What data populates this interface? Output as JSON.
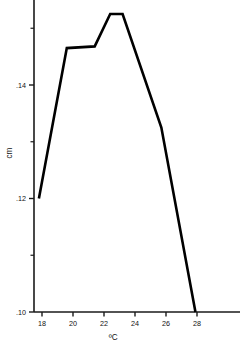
{
  "chart_data": {
    "type": "line",
    "title": "",
    "subtitle": "",
    "xlabel": "ºC",
    "ylabel": "cm",
    "xlim": [
      17.0,
      29.6
    ],
    "ylim": [
      0.0945,
      0.1565
    ],
    "grid": false,
    "legend": null,
    "x_ticks": [
      18,
      20,
      22,
      24,
      26,
      28
    ],
    "x_tick_labels": [
      "18",
      "20",
      "22",
      "24",
      "26",
      "28"
    ],
    "y_ticks": [
      0.1,
      0.11,
      0.12,
      0.13,
      0.14,
      0.15,
      0.156
    ],
    "y_tick_labels": [
      ".10",
      "",
      ".12",
      "",
      ".14",
      "",
      ""
    ],
    "y_labeled_ticks": [
      {
        "value": 0.1,
        "label": ".10"
      },
      {
        "value": 0.12,
        "label": ".12"
      },
      {
        "value": 0.14,
        "label": ".14"
      }
    ],
    "x": [
      17.8,
      19.6,
      21.4,
      22.4,
      23.2,
      25.7,
      27.9
    ],
    "values": [
      0.12,
      0.1465,
      0.1468,
      0.1525,
      0.1525,
      0.1325,
      0.1
    ],
    "series": [
      {
        "name": "",
        "points": [
          {
            "x": 17.8,
            "y": 0.12
          },
          {
            "x": 19.6,
            "y": 0.1465
          },
          {
            "x": 21.4,
            "y": 0.1468
          },
          {
            "x": 22.4,
            "y": 0.1525
          },
          {
            "x": 23.2,
            "y": 0.1525
          },
          {
            "x": 25.7,
            "y": 0.1325
          },
          {
            "x": 27.9,
            "y": 0.1
          }
        ]
      }
    ],
    "line_color": "#000000",
    "axis_color": "#1a1a1a",
    "background_color": "#ffffff"
  },
  "labels": {
    "x_axis_title": "ºC",
    "y_axis_title": "cm",
    "y_140": ".14",
    "y_120": ".12",
    "y_100": ".10",
    "x_18": "18",
    "x_20": "20",
    "x_22": "22",
    "x_24": "24",
    "x_26": "26",
    "x_28": "28"
  }
}
